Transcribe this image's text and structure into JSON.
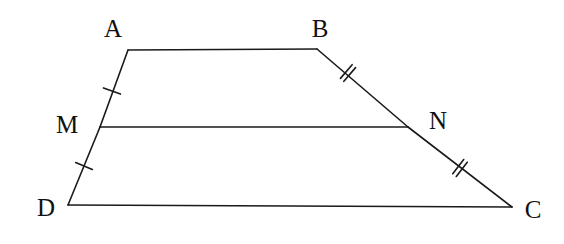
{
  "figure": {
    "type": "geometry-diagram",
    "shape": "trapezoid-with-midsegment",
    "width": 564,
    "height": 244,
    "background_color": "#ffffff",
    "stroke_color": "#1a1a1a",
    "stroke_width": 1.6
  },
  "labels": {
    "a": "A",
    "b": "B",
    "c": "C",
    "d": "D",
    "m": "M",
    "n": "N"
  },
  "label_positions": {
    "a": {
      "x": 113,
      "y": 28
    },
    "b": {
      "x": 320,
      "y": 28
    },
    "m": {
      "x": 67,
      "y": 124
    },
    "n": {
      "x": 438,
      "y": 120
    },
    "d": {
      "x": 46,
      "y": 207
    },
    "c": {
      "x": 533,
      "y": 209
    }
  },
  "vertices": {
    "A": {
      "x": 128,
      "y": 50
    },
    "B": {
      "x": 317,
      "y": 49
    },
    "M": {
      "x": 100,
      "y": 127
    },
    "N": {
      "x": 408,
      "y": 127
    },
    "D": {
      "x": 68,
      "y": 205
    },
    "C": {
      "x": 512,
      "y": 207
    }
  },
  "segments": [
    {
      "name": "AB",
      "from": "A",
      "to": "B",
      "ticks": 0
    },
    {
      "name": "AM",
      "from": "A",
      "to": "M",
      "ticks": 1
    },
    {
      "name": "MD",
      "from": "M",
      "to": "D",
      "ticks": 1
    },
    {
      "name": "BN",
      "from": "B",
      "to": "N",
      "ticks": 2
    },
    {
      "name": "NC",
      "from": "N",
      "to": "C",
      "ticks": 2
    },
    {
      "name": "MN",
      "from": "M",
      "to": "N",
      "ticks": 0
    },
    {
      "name": "DC",
      "from": "D",
      "to": "C",
      "ticks": 0
    }
  ],
  "tick_marks": [
    {
      "segment": "AM",
      "count": 1,
      "x": 112,
      "y": 91
    },
    {
      "segment": "MD",
      "count": 1,
      "x": 84,
      "y": 166
    },
    {
      "segment": "BN",
      "count": 2,
      "x": 348,
      "y": 73
    },
    {
      "segment": "NC",
      "count": 2,
      "x": 460,
      "y": 168
    }
  ]
}
